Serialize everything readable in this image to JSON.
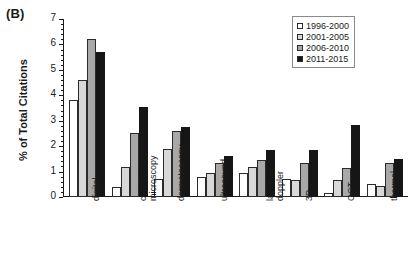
{
  "panel": {
    "label": "(B)"
  },
  "legend": {
    "position": "top-right",
    "entries": [
      {
        "label": "1996-2000",
        "color": "#fdfdfd"
      },
      {
        "label": "2001-2005",
        "color": "#d8d8d8"
      },
      {
        "label": "2006-2010",
        "color": "#a8a8a8"
      },
      {
        "label": "2011-2015",
        "color": "#161616"
      }
    ]
  },
  "axis": {
    "y_title": "% of Total Citations",
    "y_ticks": [
      "0",
      "1",
      "2",
      "3",
      "4",
      "5",
      "6",
      "7"
    ]
  },
  "chart_data": {
    "type": "bar",
    "title": "(B)",
    "xlabel": "",
    "ylabel": "% of Total Citations",
    "ylim": [
      0,
      7
    ],
    "grid": false,
    "legend_position": "top-right",
    "categories": [
      "digital",
      "confocal microscopy",
      "dermatoscopy",
      "ultrasound",
      "laser doppler",
      "3D",
      "OCT",
      "thermal"
    ],
    "series": [
      {
        "name": "1996-2000",
        "color": "#fdfdfd",
        "values": [
          3.8,
          0.4,
          0.7,
          0.8,
          0.95,
          0.7,
          0.15,
          0.5
        ]
      },
      {
        "name": "2001-2005",
        "color": "#d8d8d8",
        "values": [
          4.6,
          1.2,
          1.9,
          0.95,
          1.2,
          0.65,
          0.65,
          0.45
        ]
      },
      {
        "name": "2006-2010",
        "color": "#a8a8a8",
        "values": [
          6.2,
          2.5,
          2.6,
          1.35,
          1.45,
          1.35,
          1.15,
          1.35
        ]
      },
      {
        "name": "2011-2015",
        "color": "#161616",
        "values": [
          5.7,
          3.55,
          2.75,
          1.6,
          1.85,
          1.85,
          2.85,
          1.5
        ]
      }
    ]
  }
}
